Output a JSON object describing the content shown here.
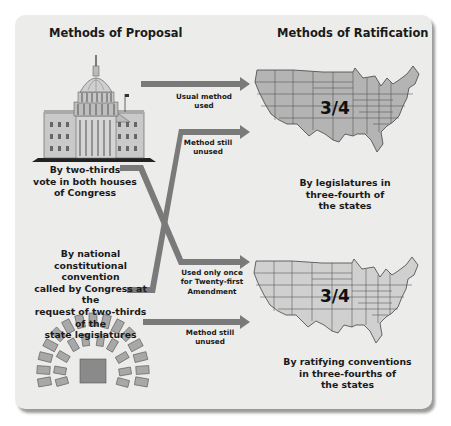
{
  "headings": {
    "proposal": "Methods of Proposal",
    "ratification": "Methods of Ratification"
  },
  "proposal_methods": [
    {
      "icon": "capitol-building-icon",
      "label_lines": [
        "By two-thirds",
        "vote in both houses",
        "of Congress"
      ]
    },
    {
      "icon": "convention-seating-icon",
      "label_lines": [
        "By national",
        "constitutional convention",
        "called by Congress at the",
        "request of two-thirds of the",
        "state legislatures"
      ]
    }
  ],
  "ratification_methods": [
    {
      "icon": "us-map-icon",
      "fraction": "3/4",
      "label_lines": [
        "By legislatures in",
        "three-fourth of",
        "the states"
      ]
    },
    {
      "icon": "us-map-icon",
      "fraction": "3/4",
      "label_lines": [
        "By ratifying conventions",
        "in three-fourths of",
        "the states"
      ]
    }
  ],
  "arrows": [
    {
      "from": "Congress",
      "to": "State legislatures",
      "label_lines": [
        "Usual method",
        "used"
      ]
    },
    {
      "from": "National convention",
      "to": "State legislatures",
      "label_lines": [
        "Method still",
        "unused"
      ]
    },
    {
      "from": "Congress",
      "to": "State conventions",
      "label_lines": [
        "Used only once",
        "for Twenty-first",
        "Amendment"
      ]
    },
    {
      "from": "National convention",
      "to": "State conventions",
      "label_lines": [
        "Method still",
        "unused"
      ]
    }
  ],
  "colors": {
    "panel": "#ececea",
    "arrow": "#7a7a7a",
    "map_fill": "#b4b4b4",
    "map_stroke": "#444444",
    "seat_fill": "#a8a8a8",
    "center_block": "#8a8a8a"
  }
}
